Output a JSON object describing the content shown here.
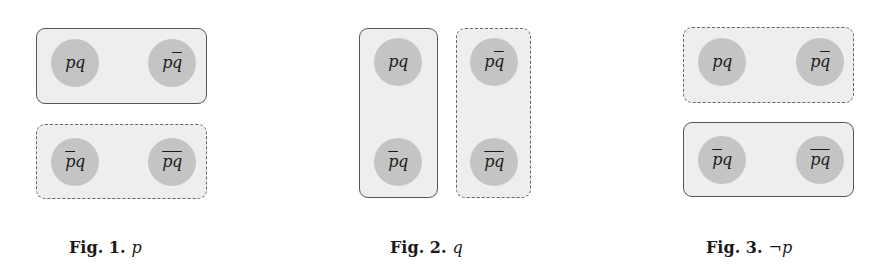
{
  "terms": {
    "pq": {
      "p": "p",
      "q": "q",
      "p_bar": false,
      "q_bar": false,
      "full_bar": false
    },
    "p_qbar": {
      "p": "p",
      "q": "q",
      "p_bar": false,
      "q_bar": true,
      "full_bar": false
    },
    "pbar_q": {
      "p": "p",
      "q": "q",
      "p_bar": true,
      "q_bar": false,
      "full_bar": false
    },
    "pq_bar": {
      "p": "p",
      "q": "q",
      "p_bar": false,
      "q_bar": false,
      "full_bar": true
    }
  },
  "figures": [
    {
      "caption_label": "Fig. 1.",
      "caption_expr": "p",
      "groups": [
        {
          "style": "solid",
          "members": [
            "pq",
            "pq̄"
          ]
        },
        {
          "style": "dashed",
          "members": [
            "p̄q",
            "(pq)̄"
          ]
        }
      ]
    },
    {
      "caption_label": "Fig. 2.",
      "caption_expr": "q",
      "groups": [
        {
          "style": "solid",
          "members": [
            "pq",
            "p̄q"
          ]
        },
        {
          "style": "dashed",
          "members": [
            "pq̄",
            "(pq)̄"
          ]
        }
      ]
    },
    {
      "caption_label": "Fig. 3.",
      "caption_expr": "¬p",
      "groups": [
        {
          "style": "dashed",
          "members": [
            "pq",
            "pq̄"
          ]
        },
        {
          "style": "solid",
          "members": [
            "p̄q",
            "(pq)̄"
          ]
        }
      ]
    }
  ],
  "colors": {
    "box_fill": "#eeeeee",
    "box_border": "#555555",
    "circle_fill": "#c4c4c4",
    "text": "#1a1a1a"
  }
}
